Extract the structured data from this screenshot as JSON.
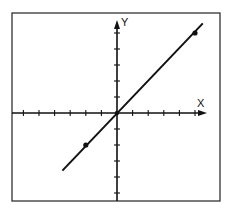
{
  "chart_data": {
    "type": "line",
    "title": "",
    "xlabel": "X",
    "ylabel": "Y",
    "xlim": [
      -6.7,
      5.9
    ],
    "ylim": [
      -5.6,
      5.9
    ],
    "grid": false,
    "legend": null,
    "x_ticks": [
      -6,
      -5,
      -4,
      -3,
      -2,
      -1,
      1,
      2,
      3,
      4,
      5
    ],
    "y_ticks": [
      -5,
      -4,
      -3,
      -2,
      -1,
      1,
      2,
      3,
      4,
      5
    ],
    "tick_labels_shown": false,
    "series": [
      {
        "name": "y = x",
        "line": {
          "x": [
            -3.5,
            5.5
          ],
          "y": [
            -3.6,
            5.6
          ]
        },
        "points": [
          {
            "x": -2,
            "y": -2
          },
          {
            "x": 5,
            "y": 5
          }
        ]
      }
    ],
    "annotations": []
  },
  "colors": {
    "ink": "#111111",
    "frame": "#333333",
    "background": "#ffffff"
  },
  "geometry": {
    "frame": {
      "x1": 12,
      "y1": 13,
      "x2": 220,
      "y2": 201
    },
    "origin": {
      "x": 117,
      "y": 113
    },
    "unit_x": 15.6,
    "unit_y": 16,
    "x_axis_end": 207,
    "y_axis_top": 20
  }
}
